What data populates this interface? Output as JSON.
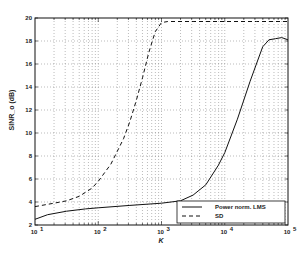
{
  "chart_data": {
    "type": "line",
    "title": "",
    "xlabel": "K",
    "ylabel": "SINR_o (dB)",
    "xscale": "log",
    "xlim": [
      10,
      100000
    ],
    "ylim": [
      2,
      20
    ],
    "grid": true,
    "legend_position": "lower right",
    "x_ticks": [
      {
        "exp": "1",
        "label": "10"
      },
      {
        "exp": "2",
        "label": "10"
      },
      {
        "exp": "3",
        "label": "10"
      },
      {
        "exp": "4",
        "label": "10"
      },
      {
        "exp": "5",
        "label": "10"
      }
    ],
    "y_ticks": [
      "2",
      "4",
      "6",
      "8",
      "10",
      "12",
      "14",
      "16",
      "18",
      "20"
    ],
    "series": [
      {
        "name": "Power norm. LMS",
        "style": "solid",
        "log10_x": [
          1.0,
          1.2,
          1.5,
          1.8,
          2.0,
          2.5,
          3.0,
          3.3,
          3.5,
          3.7,
          3.9,
          4.0,
          4.2,
          4.4,
          4.5,
          4.6,
          4.7,
          4.8,
          4.9,
          5.0
        ],
        "values": [
          2.5,
          2.9,
          3.2,
          3.4,
          3.5,
          3.7,
          3.9,
          4.1,
          4.6,
          5.5,
          7.2,
          8.3,
          11.2,
          14.5,
          16.0,
          17.5,
          18.1,
          18.2,
          18.3,
          18.1
        ]
      },
      {
        "name": "SD",
        "style": "dashed",
        "log10_x": [
          1.0,
          1.3,
          1.5,
          1.7,
          1.9,
          2.0,
          2.2,
          2.4,
          2.5,
          2.6,
          2.7,
          2.8,
          2.9,
          3.0,
          3.1,
          3.5,
          4.0,
          4.5,
          5.0
        ],
        "values": [
          3.6,
          3.9,
          4.1,
          4.5,
          5.2,
          5.8,
          7.3,
          9.5,
          11.0,
          12.8,
          14.8,
          17.0,
          18.8,
          19.6,
          19.7,
          19.7,
          19.7,
          19.7,
          19.7
        ]
      }
    ]
  },
  "legend": {
    "items": [
      {
        "label": "Power norm. LMS"
      },
      {
        "label": "SD"
      }
    ]
  }
}
